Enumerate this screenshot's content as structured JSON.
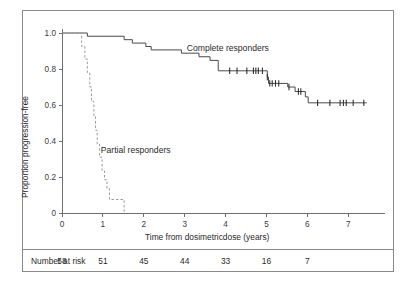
{
  "chart_data": {
    "type": "line",
    "title": "",
    "xlabel": "Time from dosimetricdose (years)",
    "ylabel": "Proportion progression-free",
    "xlim": [
      0,
      7.8
    ],
    "ylim": [
      0,
      1.05
    ],
    "grid": false,
    "legend_position": "inline-annotation",
    "x_ticks": [
      "0",
      "1",
      "2",
      "3",
      "4",
      "5",
      "6",
      "7"
    ],
    "x_tick_values": [
      0,
      1,
      2,
      3,
      4,
      5,
      6,
      7
    ],
    "y_ticks": [
      "0",
      "0.2",
      "0.4",
      "0.6",
      "0.8",
      "1.0"
    ],
    "y_tick_values": [
      0,
      0.2,
      0.4,
      0.6,
      0.8,
      1.0
    ],
    "series": [
      {
        "name": "Complete responders",
        "style": "solid",
        "color": "#4a4a4a",
        "annotation": "Complete responders",
        "steps": [
          [
            0.0,
            1.0
          ],
          [
            0.62,
            1.0
          ],
          [
            0.62,
            0.982
          ],
          [
            1.52,
            0.982
          ],
          [
            1.52,
            0.963
          ],
          [
            1.72,
            0.963
          ],
          [
            1.72,
            0.944
          ],
          [
            2.05,
            0.944
          ],
          [
            2.05,
            0.925
          ],
          [
            2.18,
            0.925
          ],
          [
            2.18,
            0.906
          ],
          [
            2.92,
            0.906
          ],
          [
            2.92,
            0.888
          ],
          [
            3.35,
            0.888
          ],
          [
            3.35,
            0.868
          ],
          [
            3.62,
            0.868
          ],
          [
            3.62,
            0.848
          ],
          [
            3.82,
            0.848
          ],
          [
            3.82,
            0.79
          ],
          [
            5.02,
            0.79
          ],
          [
            5.02,
            0.755
          ],
          [
            5.05,
            0.755
          ],
          [
            5.05,
            0.72
          ],
          [
            5.52,
            0.72
          ],
          [
            5.52,
            0.7
          ],
          [
            5.7,
            0.7
          ],
          [
            5.7,
            0.675
          ],
          [
            5.95,
            0.675
          ],
          [
            5.95,
            0.645
          ],
          [
            6.02,
            0.645
          ],
          [
            6.02,
            0.612
          ],
          [
            7.45,
            0.612
          ]
        ],
        "censor_times": [
          4.1,
          4.28,
          4.52,
          4.68,
          4.74,
          4.8,
          4.9,
          5.02,
          5.08,
          5.14,
          5.22,
          5.3,
          5.55,
          5.78,
          5.84,
          6.25,
          6.55,
          6.8,
          6.88,
          6.95,
          7.12,
          7.38
        ]
      },
      {
        "name": "Partial responders",
        "style": "dashed",
        "color": "#9a9a9a",
        "annotation": "Partial responders",
        "steps": [
          [
            0.0,
            1.0
          ],
          [
            0.48,
            1.0
          ],
          [
            0.48,
            0.925
          ],
          [
            0.56,
            0.925
          ],
          [
            0.56,
            0.855
          ],
          [
            0.62,
            0.855
          ],
          [
            0.62,
            0.78
          ],
          [
            0.68,
            0.78
          ],
          [
            0.68,
            0.7
          ],
          [
            0.72,
            0.7
          ],
          [
            0.72,
            0.62
          ],
          [
            0.78,
            0.62
          ],
          [
            0.78,
            0.54
          ],
          [
            0.82,
            0.54
          ],
          [
            0.82,
            0.46
          ],
          [
            0.86,
            0.46
          ],
          [
            0.86,
            0.385
          ],
          [
            0.92,
            0.385
          ],
          [
            0.92,
            0.31
          ],
          [
            0.98,
            0.31
          ],
          [
            0.98,
            0.235
          ],
          [
            1.04,
            0.235
          ],
          [
            1.04,
            0.185
          ],
          [
            1.1,
            0.185
          ],
          [
            1.1,
            0.135
          ],
          [
            1.16,
            0.135
          ],
          [
            1.16,
            0.075
          ],
          [
            1.52,
            0.075
          ],
          [
            1.52,
            0.0
          ]
        ],
        "censor_times": []
      }
    ]
  },
  "risk_table": {
    "label": "Number at risk",
    "times": [
      0,
      1,
      2,
      3,
      4,
      5,
      6,
      7
    ],
    "counts": [
      "58",
      "51",
      "45",
      "44",
      "33",
      "16",
      "7"
    ],
    "count_times": [
      0,
      1,
      2,
      3,
      4,
      5,
      6
    ]
  }
}
